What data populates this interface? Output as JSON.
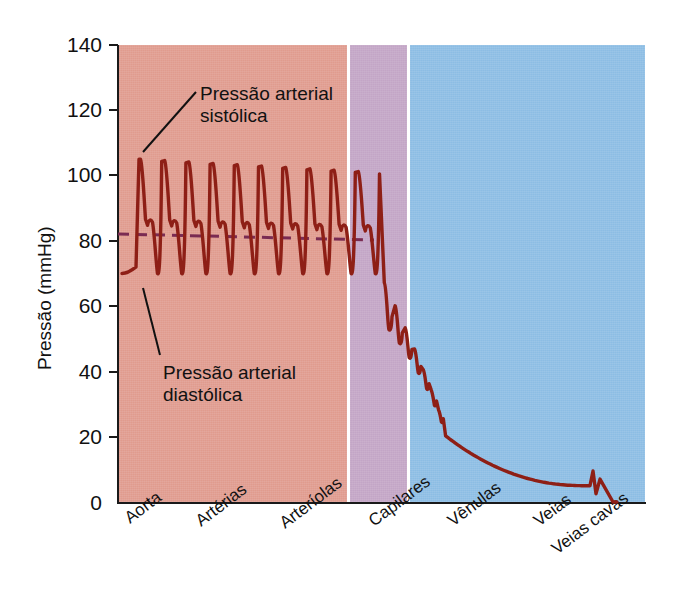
{
  "chart_data": {
    "type": "line",
    "title": "",
    "xlabel": "",
    "ylabel": "Pressão (mmHg)",
    "ylim": [
      0,
      140
    ],
    "yticks": [
      0,
      20,
      40,
      60,
      80,
      100,
      120,
      140
    ],
    "ytick_labels": [
      "0",
      "20",
      "40",
      "60",
      "80",
      "100",
      "120",
      "140"
    ],
    "grid": false,
    "legend": "none",
    "categories": [
      "Aorta",
      "Artérias",
      "Arteríolas",
      "Capilares",
      "Vênulas",
      "Veias",
      "Veias cavas"
    ],
    "regions": [
      {
        "name": "Arterial",
        "label": "arterial-band",
        "color": "#e09b8e",
        "spans": [
          "Aorta",
          "Artérias",
          "Arteríolas"
        ]
      },
      {
        "name": "Capilares",
        "label": "capillary-band",
        "color": "#c3a5c6",
        "spans": [
          "Capilares"
        ]
      },
      {
        "name": "Venoso",
        "label": "venous-band",
        "color": "#8cbde4",
        "spans": [
          "Vênulas",
          "Veias",
          "Veias cavas"
        ]
      }
    ],
    "series": [
      {
        "name": "Pressão sanguínea",
        "color": "#8e1f16",
        "systolic": 105,
        "diastolic": 70,
        "dicrotic_notch": 86,
        "pulse_count": 10,
        "description": "Pulsos arteriais de ~105/70 mmHg na aorta e artérias, amortecidos nas arteríolas, queda acentuada nos capilares (~35 a 15 mmHg), declínio suave nas vênulas e veias até ~5 mmHg, com pequena onda de pulso venoso nas veias cavas antes de cair a 0."
      },
      {
        "name": "Pressão arterial média",
        "color": "#7a2b52",
        "style": "dashed",
        "value": 82
      }
    ],
    "key_points": [
      {
        "x": "Aorta",
        "systolic": 105,
        "diastolic": 70,
        "mean": 82
      },
      {
        "x": "Artérias",
        "systolic": 103,
        "diastolic": 70,
        "mean": 82
      },
      {
        "x": "Arteríolas",
        "systolic": 60,
        "diastolic": 40,
        "mean": 48
      },
      {
        "x": "Capilares",
        "systolic": 35,
        "diastolic": 15,
        "mean": 25
      },
      {
        "x": "Vênulas",
        "systolic": 12,
        "diastolic": 12,
        "mean": 12
      },
      {
        "x": "Veias",
        "systolic": 7,
        "diastolic": 7,
        "mean": 7
      },
      {
        "x": "Veias cavas",
        "systolic": 5,
        "diastolic": 2,
        "mean": 4
      }
    ],
    "annotations": [
      {
        "id": "systolic",
        "text_line1": "Pressão arterial",
        "text_line2": "sistólica",
        "points_to": 105
      },
      {
        "id": "diastolic",
        "text_line1": "Pressão arterial",
        "text_line2": "diastólica",
        "points_to": 70
      }
    ]
  },
  "colors": {
    "arterial": "#e09b8e",
    "capillary": "#c3a5c6",
    "venous": "#8cbde4",
    "curve": "#8e1f16",
    "mean_line": "#7a2b52",
    "axis": "#1a1a1a",
    "text": "#111111"
  }
}
